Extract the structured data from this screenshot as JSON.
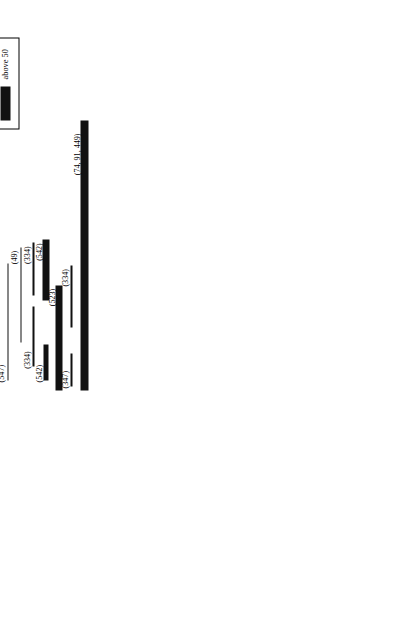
{
  "figure": {
    "orientation": "rotated-90-ccw",
    "axis": {
      "label": "",
      "min": 0,
      "max": 7400,
      "unit": "bp",
      "ticks": [
        {
          "value": 0,
          "label": "0"
        },
        {
          "value": 500,
          "label": ""
        },
        {
          "value": 1000,
          "label": "1K"
        },
        {
          "value": 1500,
          "label": ""
        },
        {
          "value": 2000,
          "label": "2K"
        },
        {
          "value": 2500,
          "label": ""
        },
        {
          "value": 3000,
          "label": "3K"
        },
        {
          "value": 3500,
          "label": ""
        },
        {
          "value": 4000,
          "label": "4K"
        },
        {
          "value": 4500,
          "label": ""
        },
        {
          "value": 5000,
          "label": "5K"
        },
        {
          "value": 5500,
          "label": ""
        },
        {
          "value": 6000,
          "label": "6K"
        },
        {
          "value": 6500,
          "label": ""
        },
        {
          "value": 7000,
          "label": "7K"
        }
      ]
    },
    "gene_map": {
      "segments": [
        {
          "name": "18S",
          "type": "box",
          "start": 0,
          "end": 1900,
          "label": "18S"
        },
        {
          "name": "ITS1",
          "type": "spacer",
          "start": 1900,
          "end": 2560,
          "label": "ITS1"
        },
        {
          "name": "5.8S",
          "type": "box",
          "start": 2560,
          "end": 2740,
          "label": "5.8S"
        },
        {
          "name": "ITS2",
          "type": "spacer",
          "start": 2740,
          "end": 3280,
          "label": "ITS2"
        },
        {
          "name": "28S",
          "type": "box",
          "start": 3280,
          "end": 7310,
          "label": "28S"
        }
      ],
      "d_regions": [
        {
          "label": "D1",
          "start": 3400,
          "end": 3830
        },
        {
          "label": "D2",
          "start": 3880,
          "end": 4280
        },
        {
          "label": "D3",
          "start": 4330,
          "end": 4560
        },
        {
          "label": "D4",
          "start": 4570,
          "end": 4780
        },
        {
          "label": "D5",
          "start": 4790,
          "end": 5010
        },
        {
          "label": "D7",
          "start": 5380,
          "end": 5760
        }
      ]
    },
    "groups": [
      {
        "id": "entognatha",
        "title": "ENTOGNATHA,\nAPTERYGOTA &\nPALEOPTERA"
      },
      {
        "id": "orthopteroidea",
        "title": "ORTHOPTEROIDEA"
      },
      {
        "id": "hemipteroidea",
        "title": "HEMIPTEROIDEA"
      }
    ],
    "bars": [
      {
        "group": "entognatha",
        "lane": 0,
        "start": 0,
        "end": 3320,
        "weight": "21-30",
        "label": "(91, 187, 243, 284, 285, 450)",
        "label_at": "end"
      },
      {
        "group": "entognatha",
        "lane": 1,
        "start": 520,
        "end": 1940,
        "weight": "1-10",
        "label": "(173)",
        "label_at": "end"
      },
      {
        "group": "entognatha",
        "lane": 1,
        "start": 3570,
        "end": 4450,
        "weight": "31-40",
        "label": "(79, 166, 172, 547)",
        "label_at": "start"
      },
      {
        "group": "entognatha",
        "lane": 2,
        "start": 180,
        "end": 1080,
        "weight": "1-10",
        "label": "(547)",
        "label_at": "start"
      },
      {
        "group": "entognatha",
        "lane": 2,
        "start": 1280,
        "end": 2080,
        "weight": "1-10",
        "label": "(367)",
        "label_at": "end"
      },
      {
        "group": "entognatha",
        "lane": 2,
        "start": 3380,
        "end": 4200,
        "weight": "1-10",
        "label": "(173*, 175)",
        "label_at": "start"
      },
      {
        "group": "entognatha",
        "lane": 3,
        "start": 560,
        "end": 1400,
        "weight": "1-10",
        "label": "(367)",
        "label_at": "start"
      },
      {
        "group": "entognatha",
        "lane": 3,
        "start": 1560,
        "end": 2340,
        "weight": "1-10",
        "label": "(173*)",
        "label_at": "end"
      },
      {
        "group": "entognatha",
        "lane": 3,
        "start": 3940,
        "end": 4780,
        "weight": "1-10",
        "label": "(173*, 175)",
        "label_at": "start"
      },
      {
        "group": "entognatha",
        "lane": 4,
        "start": 760,
        "end": 1620,
        "weight": "1-10",
        "label": "(367)",
        "label_at": "start"
      },
      {
        "group": "entognatha",
        "lane": 4,
        "start": 4520,
        "end": 5400,
        "weight": "1-10",
        "label": "(173*, 175)",
        "label_at": "start"
      },
      {
        "group": "entognatha",
        "lane": 5,
        "start": 4940,
        "end": 5900,
        "weight": "1-10",
        "label": "(173*, 175)",
        "label_at": "start"
      },
      {
        "group": "orthopteroidea",
        "lane": 0,
        "start": 0,
        "end": 2520,
        "weight": "above 50",
        "label": "(91, 163)",
        "label_at": "end"
      },
      {
        "group": "orthopteroidea",
        "lane": 0,
        "start": 3130,
        "end": 3900,
        "weight": "1-10",
        "label": "(175)",
        "label_at": "start"
      },
      {
        "group": "orthopteroidea",
        "lane": 0,
        "start": 5260,
        "end": 6080,
        "weight": "1-10",
        "label": "(175)",
        "label_at": "start"
      },
      {
        "group": "orthopteroidea",
        "lane": 1,
        "start": 380,
        "end": 1380,
        "weight": "1-10",
        "label": "(547)",
        "label_at": "end"
      },
      {
        "group": "orthopteroidea",
        "lane": 1,
        "start": 4240,
        "end": 5060,
        "weight": "1-10",
        "label": "(547)",
        "label_at": "start"
      },
      {
        "group": "orthopteroidea",
        "lane": 2,
        "start": 240,
        "end": 1120,
        "weight": "1-10",
        "label": "(367)",
        "label_at": "start"
      },
      {
        "group": "orthopteroidea",
        "lane": 2,
        "start": 1300,
        "end": 2120,
        "weight": "1-10",
        "label": "(367)",
        "label_at": "end"
      },
      {
        "group": "orthopteroidea",
        "lane": 2,
        "start": 3260,
        "end": 4020,
        "weight": "1-10",
        "label": "(274)",
        "label_at": "start"
      },
      {
        "group": "orthopteroidea",
        "lane": 3,
        "start": 620,
        "end": 1480,
        "weight": "1-10",
        "label": "(367)",
        "label_at": "start"
      },
      {
        "group": "hemipteroidea",
        "lane": 0,
        "start": 220,
        "end": 1120,
        "weight": "1-10",
        "label": "(367)",
        "label_at": "start"
      },
      {
        "group": "hemipteroidea",
        "lane": 0,
        "start": 1320,
        "end": 2160,
        "weight": "1-10",
        "label": "(367)",
        "label_at": "end"
      },
      {
        "group": "hemipteroidea",
        "lane": 1,
        "start": 600,
        "end": 1440,
        "weight": "1-10",
        "label": "(367)",
        "label_at": "start"
      },
      {
        "group": "hemipteroidea",
        "lane": 1,
        "start": 1600,
        "end": 2420,
        "weight": "1-10",
        "label": "(367)",
        "label_at": "end"
      },
      {
        "group": "hemipteroidea",
        "lane": 2,
        "start": 140,
        "end": 1060,
        "weight": "1-10",
        "label": "(75)",
        "label_at": "start"
      },
      {
        "group": "hemipteroidea",
        "lane": 2,
        "start": 1120,
        "end": 3480,
        "weight": "1-10",
        "label": "(41)",
        "label_at": "end"
      },
      {
        "group": "hemipteroidea",
        "lane": 3,
        "start": 520,
        "end": 1320,
        "weight": "11-20",
        "label": "(113)",
        "label_at": "start"
      },
      {
        "group": "hemipteroidea",
        "lane": 3,
        "start": 1400,
        "end": 2620,
        "weight": "21-30",
        "label": "(160)",
        "label_at": "end"
      },
      {
        "group": "hemipteroidea",
        "lane": 4,
        "start": 320,
        "end": 1180,
        "weight": "1-10",
        "label": "(73)",
        "label_at": "start"
      },
      {
        "group": "hemipteroidea",
        "lane": 4,
        "start": 1240,
        "end": 2880,
        "weight": "21-30",
        "label": "(232)",
        "label_at": "end"
      },
      {
        "group": "hemipteroidea",
        "lane": 5,
        "start": 200,
        "end": 1740,
        "weight": "1-10",
        "label": "(547)",
        "label_at": "start"
      },
      {
        "group": "hemipteroidea",
        "lane": 6,
        "start": 700,
        "end": 1960,
        "weight": "1-10",
        "label": "(49)",
        "label_at": "end"
      },
      {
        "group": "hemipteroidea",
        "lane": 7,
        "start": 380,
        "end": 1180,
        "weight": "1-10",
        "label": "(334)",
        "label_at": "start"
      },
      {
        "group": "hemipteroidea",
        "lane": 7,
        "start": 1320,
        "end": 2020,
        "weight": "1-10",
        "label": "(334)",
        "label_at": "end"
      },
      {
        "group": "hemipteroidea",
        "lane": 8,
        "start": 200,
        "end": 680,
        "weight": "31-40",
        "label": "(542)",
        "label_at": "start"
      },
      {
        "group": "hemipteroidea",
        "lane": 8,
        "start": 1260,
        "end": 2060,
        "weight": "41-50",
        "label": "(542)",
        "label_at": "end"
      },
      {
        "group": "hemipteroidea",
        "lane": 9,
        "start": 60,
        "end": 1460,
        "weight": "41-50",
        "label": "(523)",
        "label_at": "end"
      },
      {
        "group": "hemipteroidea",
        "lane": 10,
        "start": 120,
        "end": 560,
        "weight": "1-10",
        "label": "(347)",
        "label_at": "start"
      },
      {
        "group": "hemipteroidea",
        "lane": 10,
        "start": 900,
        "end": 1720,
        "weight": "1-10",
        "label": "(334)",
        "label_at": "end"
      },
      {
        "group": "hemipteroidea",
        "lane": 11,
        "start": 60,
        "end": 3640,
        "weight": "above 50",
        "label": "(74, 91, 449)",
        "label_at": "end"
      }
    ],
    "legend": {
      "title": "No. of sequences",
      "items": [
        {
          "label": "1-10",
          "thickness": 1
        },
        {
          "label": "11-20",
          "thickness": 2
        },
        {
          "label": "21-30",
          "thickness": 4
        },
        {
          "label": "31-40",
          "thickness": 6
        },
        {
          "label": "41-50",
          "thickness": 8
        },
        {
          "label": "above 50",
          "thickness": 10
        }
      ]
    },
    "colors": {
      "ink": "#111111",
      "rule": "#777777",
      "paper": "#ffffff"
    }
  }
}
